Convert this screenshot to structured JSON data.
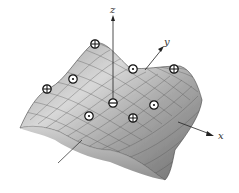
{
  "diagram": {
    "axes": {
      "x": {
        "label": "x"
      },
      "y": {
        "label": "y"
      },
      "z": {
        "label": "z"
      }
    },
    "legend_symbols": {
      "maximum": "⊕",
      "saddle": "⊙",
      "minimum": "⊖"
    },
    "critical_points": [
      {
        "type": "maximum",
        "x": 95,
        "y": 44
      },
      {
        "type": "maximum",
        "x": 174,
        "y": 69
      },
      {
        "type": "maximum",
        "x": 47,
        "y": 89
      },
      {
        "type": "maximum",
        "x": 133,
        "y": 118
      },
      {
        "type": "saddle",
        "x": 133,
        "y": 69
      },
      {
        "type": "saddle",
        "x": 73,
        "y": 79
      },
      {
        "type": "saddle",
        "x": 154,
        "y": 105
      },
      {
        "type": "saddle",
        "x": 89,
        "y": 116
      },
      {
        "type": "minimum",
        "x": 113,
        "y": 103
      }
    ]
  }
}
